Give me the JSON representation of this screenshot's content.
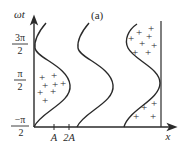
{
  "figure": {
    "panel_label": "(a)",
    "y_axis_label": "ωt",
    "x_axis_label": "x",
    "y_ticks": [
      {
        "num": "3π",
        "den": "2"
      },
      {
        "num": "π",
        "den": "2"
      },
      {
        "num": "−π",
        "den": "2"
      }
    ],
    "x_ticks": [
      "A",
      "2A"
    ],
    "charge_symbol": "+",
    "colors": {
      "line": "#2a2a2a",
      "background": "#ffffff"
    }
  }
}
